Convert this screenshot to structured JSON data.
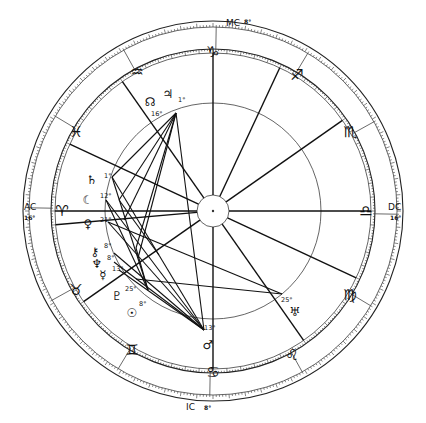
{
  "chart_data": {
    "type": "astrological-natal-chart",
    "center": [
      213,
      211
    ],
    "radii": {
      "outer": 190,
      "outer_inner": 184,
      "zodiac_inner": 162,
      "zodiac_inner2": 158,
      "aspect_circle": 108,
      "center_circle": 16
    },
    "angles": [
      {
        "name": "AC",
        "label": "AC",
        "degree": "16°",
        "position": "left"
      },
      {
        "name": "DC",
        "label": "DC",
        "degree": "16°",
        "position": "right"
      },
      {
        "name": "MC",
        "label": "MC",
        "degree": "8°",
        "position": "top"
      },
      {
        "name": "IC",
        "label": "IC",
        "degree": "8°",
        "position": "bottom"
      }
    ],
    "signs": [
      {
        "name": "aries",
        "glyph": "♈",
        "x": 62,
        "y": 211
      },
      {
        "name": "taurus",
        "glyph": "♉",
        "x": 76,
        "y": 290
      },
      {
        "name": "gemini",
        "glyph": "♊",
        "x": 132,
        "y": 350
      },
      {
        "name": "cancer",
        "glyph": "♋",
        "x": 213,
        "y": 372
      },
      {
        "name": "leo",
        "glyph": "♌",
        "x": 292,
        "y": 355
      },
      {
        "name": "virgo",
        "glyph": "♍",
        "x": 350,
        "y": 295
      },
      {
        "name": "libra",
        "glyph": "♎",
        "x": 366,
        "y": 211
      },
      {
        "name": "scorpio",
        "glyph": "♏",
        "x": 350,
        "y": 132
      },
      {
        "name": "sagittarius",
        "glyph": "♐",
        "x": 297,
        "y": 75
      },
      {
        "name": "capricorn",
        "glyph": "♑",
        "x": 213,
        "y": 52
      },
      {
        "name": "aquarius",
        "glyph": "♒",
        "x": 137,
        "y": 72
      },
      {
        "name": "pisces",
        "glyph": "♓",
        "x": 76,
        "y": 132
      }
    ],
    "planets": [
      {
        "name": "saturn",
        "glyph": "♄",
        "degree": "1°",
        "x": 92,
        "y": 180,
        "dx": 104,
        "dy": 178
      },
      {
        "name": "moon",
        "glyph": "☾",
        "degree": "12°",
        "x": 88,
        "y": 200,
        "dx": 100,
        "dy": 198
      },
      {
        "name": "venus",
        "glyph": "♀",
        "degree": "21°",
        "x": 88,
        "y": 224,
        "dx": 100,
        "dy": 222
      },
      {
        "name": "chiron",
        "glyph": "⚷",
        "degree": "8°",
        "x": 95,
        "y": 252,
        "dx": 104,
        "dy": 248
      },
      {
        "name": "neptune",
        "glyph": "♆",
        "degree": "8°",
        "x": 97,
        "y": 264,
        "dx": 107,
        "dy": 260
      },
      {
        "name": "mercury",
        "glyph": "☿",
        "degree": "13°",
        "x": 103,
        "y": 275,
        "dx": 112,
        "dy": 271
      },
      {
        "name": "pluto",
        "glyph": "♇",
        "degree": "25°",
        "x": 117,
        "y": 296,
        "dx": 125,
        "dy": 291
      },
      {
        "name": "sun",
        "glyph": "☉",
        "degree": "8°",
        "x": 132,
        "y": 313,
        "dx": 139,
        "dy": 306
      },
      {
        "name": "mars",
        "glyph": "♂",
        "degree": "13°",
        "x": 208,
        "y": 345,
        "dx": 204,
        "dy": 330
      },
      {
        "name": "uranus",
        "glyph": "♅",
        "degree": "25°",
        "x": 295,
        "y": 312,
        "dx": 281,
        "dy": 302
      },
      {
        "name": "north-node",
        "glyph": "☊",
        "degree": "16°",
        "x": 150,
        "y": 102,
        "dx": 151,
        "dy": 116
      },
      {
        "name": "jupiter",
        "glyph": "♃",
        "degree": "1°",
        "x": 168,
        "y": 94,
        "dx": 178,
        "dy": 102
      }
    ],
    "aspect_lines": [
      [
        176,
        113,
        112,
        177
      ],
      [
        176,
        113,
        119,
        200
      ],
      [
        176,
        113,
        124,
        220
      ],
      [
        176,
        113,
        136,
        248
      ],
      [
        176,
        113,
        138,
        258
      ],
      [
        176,
        113,
        204,
        330
      ],
      [
        112,
        177,
        204,
        330
      ],
      [
        112,
        177,
        148,
        290
      ],
      [
        106,
        200,
        204,
        330
      ],
      [
        106,
        200,
        148,
        290
      ],
      [
        108,
        222,
        204,
        330
      ],
      [
        108,
        222,
        282,
        294
      ],
      [
        114,
        253,
        204,
        330
      ],
      [
        114,
        262,
        204,
        330
      ],
      [
        119,
        270,
        204,
        330
      ],
      [
        136,
        279,
        282,
        294
      ],
      [
        119,
        200,
        159,
        255
      ],
      [
        148,
        290,
        136,
        248
      ]
    ],
    "house_cusps_deg": [
      180,
      0,
      90,
      270,
      205,
      235,
      325,
      355,
      25,
      55,
      145,
      115
    ]
  }
}
